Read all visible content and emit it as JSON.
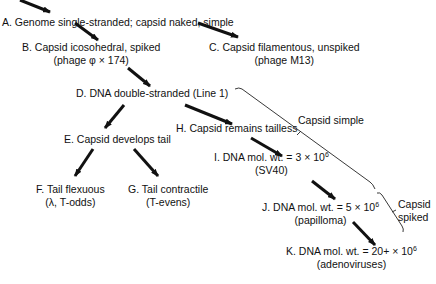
{
  "diagram": {
    "type": "evolutionary-tree",
    "nodes": [
      {
        "id": "A",
        "line1": "A. Genome single-stranded; capsid naked, simple",
        "line2": ""
      },
      {
        "id": "B",
        "line1": "B. Capsid icosohedral, spiked",
        "line2": "(phage φ × 174)"
      },
      {
        "id": "C",
        "line1": "C. Capsid filamentous, unspiked",
        "line2": "(phage M13)"
      },
      {
        "id": "D",
        "line1": "D. DNA double-stranded (Line 1)",
        "line2": ""
      },
      {
        "id": "E",
        "line1": "E. Capsid develops tail",
        "line2": ""
      },
      {
        "id": "F",
        "line1": "F. Tail flexuous",
        "line2": "(λ, T-odds)"
      },
      {
        "id": "G",
        "line1": "G. Tail contractile",
        "line2": "(T-evens)"
      },
      {
        "id": "H",
        "line1": "H. Capsid remains tailless",
        "line2": ""
      },
      {
        "id": "I",
        "line1_prefix": "I. DNA mol. wt. = 3 × 10",
        "exp": "6",
        "line2": "(SV40)"
      },
      {
        "id": "J",
        "line1_prefix": "J. DNA mol. wt. = 5 × 10",
        "exp": "6",
        "line2": "(papilloma)"
      },
      {
        "id": "K",
        "line1_prefix": "K. DNA mol. wt. = 20+ × 10",
        "exp": "6",
        "line2": "(adenoviruses)"
      }
    ],
    "edges": [
      [
        "entry",
        "A"
      ],
      [
        "A",
        "B"
      ],
      [
        "A",
        "C"
      ],
      [
        "B",
        "D"
      ],
      [
        "D",
        "E"
      ],
      [
        "D",
        "H"
      ],
      [
        "E",
        "F"
      ],
      [
        "E",
        "G"
      ],
      [
        "H",
        "I"
      ],
      [
        "I",
        "J"
      ],
      [
        "J",
        "K"
      ]
    ],
    "brackets": {
      "simple": {
        "label": "Capsid simple"
      },
      "spiked": {
        "label_line1": "Capsid",
        "label_line2": "spiked"
      }
    }
  }
}
